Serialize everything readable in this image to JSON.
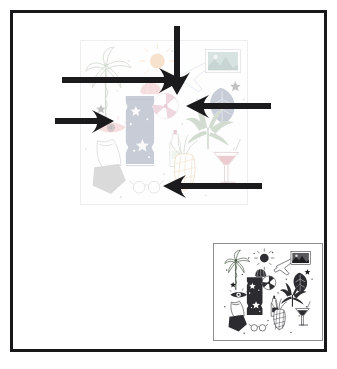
{
  "canvas": {
    "width": 337,
    "height": 369,
    "background_color": "#ffffff",
    "frame_color": "#18181a",
    "frame_thickness": 3
  },
  "main_artwork": {
    "label": "tropical-summer-pattern-large",
    "description": "Faded hand-drawn tropical summer doodle pattern: palm tree, sun, seashell, airplane, postcard, pinwheel, monstera leaf, eye, swimsuit, bottle, pineapple, cocktail glass, stars and dots",
    "x": 80,
    "y": 40,
    "width": 168,
    "height": 165,
    "opacity": "0.30",
    "border_color": "#eeeeee"
  },
  "thumbnail_artwork": {
    "label": "tropical-summer-pattern-thumbnail",
    "description": "Same tropical summer doodle pattern rendered at full contrast as a small preview tile",
    "x": 213,
    "y": 243,
    "width": 110,
    "height": 98,
    "opacity": "1",
    "border_color": "#8d8d8d"
  },
  "annotations": {
    "arrow_color": "#1b1b1e",
    "count": 5,
    "items": [
      {
        "name": "arrow-down-top",
        "direction": "down",
        "tail_x": 177,
        "tail_y": 26,
        "tip_x": 177,
        "tip_y": 93
      },
      {
        "name": "arrow-right-upper",
        "direction": "right",
        "tail_x": 62,
        "tail_y": 80,
        "tip_x": 180,
        "tip_y": 80
      },
      {
        "name": "arrow-right-lower",
        "direction": "right",
        "tail_x": 55,
        "tail_y": 121,
        "tip_x": 112,
        "tip_y": 121
      },
      {
        "name": "arrow-left-upper",
        "direction": "left",
        "tail_x": 271,
        "tail_y": 106,
        "tip_x": 187,
        "tip_y": 106
      },
      {
        "name": "arrow-left-lower",
        "direction": "left",
        "tail_x": 262,
        "tail_y": 186,
        "tip_x": 163,
        "tip_y": 186
      }
    ]
  },
  "art_elements": [
    "palm-tree",
    "sun",
    "seashell",
    "airplane",
    "postcard",
    "star",
    "pinwheel",
    "monstera-leaf",
    "eye",
    "swimsuit",
    "bottle",
    "pineapple",
    "cocktail-glass",
    "leaf-drop",
    "confetti-dots"
  ]
}
